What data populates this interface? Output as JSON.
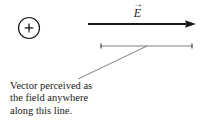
{
  "figure": {
    "background_color": "#ffffff",
    "stroke_color": "#1a1a1a",
    "width": 204,
    "height": 122
  },
  "charge": {
    "symbol": "+",
    "name": "positive point charge",
    "center_x": 29,
    "center_y": 28,
    "radius": 11
  },
  "field_vector": {
    "symbol": "E",
    "vector_accent": "→",
    "label_text": "E",
    "start_x": 88,
    "end_x": 196,
    "y": 24
  },
  "field_line": {
    "name": "line of perception",
    "start_x": 101,
    "end_x": 192,
    "y": 46
  },
  "leader_line": {
    "from_x": 147,
    "from_y": 46,
    "to_x": 78,
    "to_y": 79
  },
  "caption": {
    "lines": [
      "Vector perceived as",
      "the field anywhere",
      "along this line."
    ],
    "line1": "Vector perceived as",
    "line2": "the field anywhere",
    "line3": "along this line."
  }
}
